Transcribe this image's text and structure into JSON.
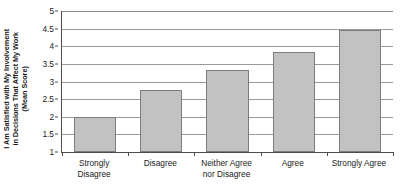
{
  "chart_data": {
    "type": "bar",
    "title": "",
    "xlabel": "",
    "ylabel": "I Am Satisfied with My Involvement in Decisions That Affect My Work (Mean Score)",
    "ylabel_lines": [
      "I Am Satisfied with My Involvement",
      "in Decisions That Affect My Work",
      "(Mean Score)"
    ],
    "categories": [
      "Strongly\nDisagree",
      "Disagree",
      "Neither Agree\nnor Disagree",
      "Agree",
      "Strongly Agree"
    ],
    "values": [
      2.0,
      2.75,
      3.33,
      3.85,
      4.45
    ],
    "ylim": [
      1,
      5
    ],
    "ytick_labels": [
      "1",
      "1.5",
      "2",
      "2.5",
      "3",
      "3.5",
      "4",
      "4.5",
      "5"
    ],
    "ytick_values": [
      1,
      1.5,
      2,
      2.5,
      3,
      3.5,
      4,
      4.5,
      5
    ],
    "grid": true,
    "legend": false,
    "bar_color": "#c2c2c2",
    "bar_border_color": "#7d7d7d",
    "gridline_color": "#9a9a9a",
    "axis_color": "#4d4d4d"
  }
}
